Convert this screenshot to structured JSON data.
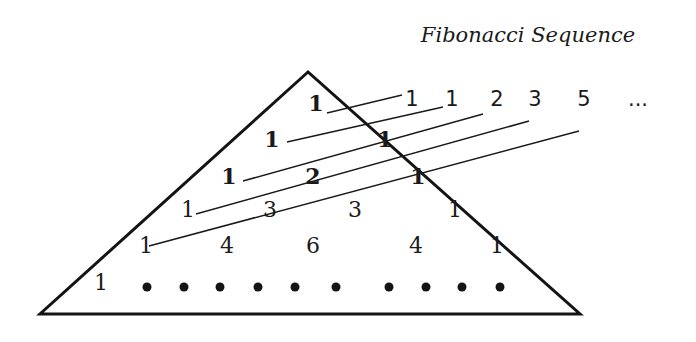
{
  "title": "Fibonacci Sequence",
  "triangle": {
    "apex": [
      308,
      72
    ],
    "bottom_left": [
      40,
      314
    ],
    "bottom_right": [
      580,
      314
    ]
  },
  "rows": [
    {
      "values": [
        "1"
      ],
      "positions": [
        [
          316,
          111
        ]
      ]
    },
    {
      "values": [
        "1",
        "1"
      ],
      "positions": [
        [
          272,
          147
        ],
        [
          385,
          147
        ]
      ]
    },
    {
      "values": [
        "1",
        "2",
        "1"
      ],
      "positions": [
        [
          229,
          184
        ],
        [
          313,
          184
        ],
        [
          418,
          184
        ]
      ]
    },
    {
      "values": [
        "1",
        "3",
        "3",
        "1"
      ],
      "positions": [
        [
          188,
          217
        ],
        [
          270,
          217
        ],
        [
          355,
          217
        ],
        [
          455,
          217
        ]
      ]
    },
    {
      "values": [
        "1",
        "4",
        "6",
        "4",
        "1"
      ],
      "positions": [
        [
          146,
          253
        ],
        [
          227,
          253
        ],
        [
          313,
          253
        ],
        [
          416,
          253
        ],
        [
          497,
          253
        ]
      ]
    },
    {
      "values": [
        "1"
      ],
      "positions": [
        [
          101,
          290
        ]
      ]
    }
  ],
  "bottom_row_dots": [
    [
      147,
      287
    ],
    [
      184,
      287
    ],
    [
      220,
      287
    ],
    [
      258,
      287
    ],
    [
      295,
      287
    ],
    [
      336,
      287
    ],
    [
      389,
      287
    ],
    [
      426,
      287
    ],
    [
      462,
      287
    ],
    [
      500,
      287
    ]
  ],
  "sequence": {
    "values": [
      "1",
      "1",
      "2",
      "3",
      "5",
      "..."
    ],
    "x": [
      412,
      452,
      497,
      535,
      584,
      638
    ],
    "y": 106
  },
  "diagonal_lines": [
    [
      327,
      113,
      402,
      95
    ],
    [
      287,
      142,
      443,
      107
    ],
    [
      243,
      181,
      483,
      114
    ],
    [
      196,
      214,
      529,
      121
    ],
    [
      149,
      246,
      579,
      131
    ]
  ],
  "chart_data": {
    "type": "diagram",
    "title": "Fibonacci Sequence",
    "pascal_triangle_rows": [
      [
        1
      ],
      [
        1,
        1
      ],
      [
        1,
        2,
        1
      ],
      [
        1,
        3,
        3,
        1
      ],
      [
        1,
        4,
        6,
        4,
        1
      ],
      [
        "1",
        "•",
        "•",
        "•",
        "•",
        "•",
        "•",
        "•",
        "•",
        "•",
        "•"
      ]
    ],
    "fibonacci_sums": [
      1,
      1,
      2,
      3,
      5,
      "..."
    ],
    "annotation": "Shallow diagonals of Pascal's triangle sum to Fibonacci numbers"
  }
}
